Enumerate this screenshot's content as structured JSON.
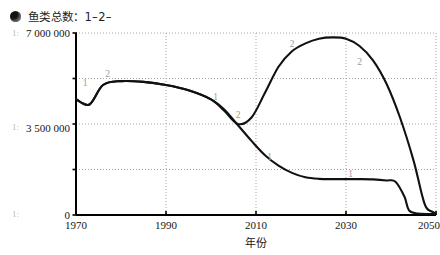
{
  "legend": {
    "marker_icon": "filled-circle-icon",
    "text": "鱼类总数：1–2–"
  },
  "margin_marks": [
    "1:",
    "1:",
    "1:"
  ],
  "chart_data": {
    "type": "line",
    "title": "鱼类总数：1–2–",
    "xlabel": "年份",
    "ylabel": "",
    "xlim": [
      1970,
      2050
    ],
    "ylim": [
      0,
      7000000
    ],
    "grid": true,
    "legend_position": "top-left",
    "x_ticks": [
      1970,
      1990,
      2010,
      2030,
      2050
    ],
    "x_tick_labels": [
      "1970",
      "1990",
      "2010",
      "2030",
      "2050"
    ],
    "y_ticks": [
      0,
      3500000,
      7000000
    ],
    "y_tick_labels": [
      "0",
      "3 500 000",
      "7 000 000"
    ],
    "y_minor_ticks": [
      1750000,
      5250000
    ],
    "series": [
      {
        "name": "1",
        "marker_label": "1",
        "x": [
          1970,
          1973,
          1976,
          1980,
          1985,
          1990,
          1995,
          2000,
          2003,
          2006,
          2009,
          2012,
          2015,
          2018,
          2021,
          2024,
          2027,
          2030,
          2033,
          2036,
          2039,
          2041,
          2043,
          2044,
          2046,
          2050
        ],
        "values": [
          4450000,
          4250000,
          5000000,
          5150000,
          5120000,
          5000000,
          4800000,
          4450000,
          4050000,
          3450000,
          2850000,
          2300000,
          1900000,
          1620000,
          1450000,
          1390000,
          1380000,
          1380000,
          1380000,
          1370000,
          1330000,
          1280000,
          700000,
          180000,
          60000,
          40000
        ]
      },
      {
        "name": "2",
        "marker_label": "2",
        "x": [
          1970,
          1973,
          1976,
          1980,
          1985,
          1990,
          1995,
          2000,
          2003,
          2006,
          2009,
          2012,
          2015,
          2018,
          2021,
          2024,
          2027,
          2030,
          2033,
          2036,
          2039,
          2042,
          2045,
          2047,
          2048,
          2050
        ],
        "values": [
          4450000,
          4250000,
          5000000,
          5150000,
          5120000,
          5000000,
          4800000,
          4450000,
          4000000,
          3500000,
          3750000,
          4700000,
          5700000,
          6300000,
          6600000,
          6780000,
          6830000,
          6780000,
          6500000,
          5950000,
          5050000,
          3750000,
          2100000,
          700000,
          250000,
          60000
        ]
      }
    ],
    "point_labels": [
      {
        "series": "1",
        "label": "1",
        "x": 1972,
        "y": 4950000
      },
      {
        "series": "2",
        "label": "2",
        "x": 1977,
        "y": 5320000
      },
      {
        "series": "1",
        "label": "1",
        "x": 2001,
        "y": 4420000
      },
      {
        "series": "2",
        "label": "2",
        "x": 2006,
        "y": 3720000
      },
      {
        "series": "2",
        "label": "2",
        "x": 2018,
        "y": 6450000
      },
      {
        "series": "2",
        "label": "2",
        "x": 2033,
        "y": 5780000
      },
      {
        "series": "1",
        "label": "1",
        "x": 2013,
        "y": 2100000
      },
      {
        "series": "1",
        "label": "1",
        "x": 2031,
        "y": 1450000
      }
    ],
    "colors": {
      "line": "#111111",
      "grid": "#9b9b9b",
      "axis": "#000000"
    }
  }
}
